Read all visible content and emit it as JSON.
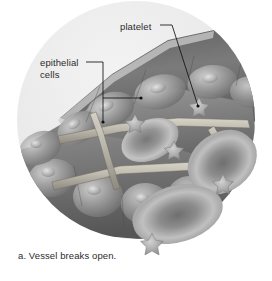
{
  "figure": {
    "caption": "a. Vessel breaks open.",
    "labels": {
      "epithelial_line1": "epithelial",
      "epithelial_line2": "cells",
      "platelet": "platelet"
    },
    "colors": {
      "background": "#ffffff",
      "vignette_light": "#e8e8e8",
      "tissue_dark": "#6b6b6b",
      "tissue_mid": "#8f8f8f",
      "tissue_light": "#c9c9c9",
      "rbc_dark": "#7d7d7d",
      "rbc_light": "#c6c6c6",
      "platelet_fill": "#b9b9b9",
      "leader_line": "#1a1a1a",
      "text": "#2b2b2b"
    },
    "elements": {
      "vignette_circle": {
        "cx": 136,
        "cy": 120,
        "r": 119
      },
      "leaders": [
        {
          "name": "epithelial-leader-vertical",
          "from": [
            103,
            62
          ],
          "to": [
            103,
            122
          ]
        },
        {
          "name": "epithelial-leader-diagonal",
          "from": [
            103,
            98
          ],
          "to": [
            140,
            98
          ]
        },
        {
          "name": "platelet-leader",
          "from": [
            166,
            25
          ],
          "to": [
            198,
            106
          ]
        }
      ],
      "platelets": [
        {
          "name": "platelet-upper-right",
          "cx": 199,
          "cy": 108,
          "r": 11
        },
        {
          "name": "platelet-mid",
          "cx": 135,
          "cy": 124,
          "r": 10
        },
        {
          "name": "platelet-center",
          "cx": 174,
          "cy": 151,
          "r": 10
        },
        {
          "name": "platelet-right",
          "cx": 223,
          "cy": 185,
          "r": 11
        },
        {
          "name": "platelet-bottom",
          "cx": 152,
          "cy": 245,
          "r": 12
        }
      ],
      "red_blood_cells": [
        {
          "name": "rbc-right-upper",
          "cx": 221,
          "cy": 160,
          "rx": 36,
          "ry": 27,
          "rot": -35
        },
        {
          "name": "rbc-bottom",
          "cx": 175,
          "cy": 212,
          "rx": 44,
          "ry": 26,
          "rot": -18
        },
        {
          "name": "rbc-inner-left",
          "cx": 152,
          "cy": 140,
          "rx": 30,
          "ry": 20,
          "rot": -25
        }
      ]
    }
  }
}
